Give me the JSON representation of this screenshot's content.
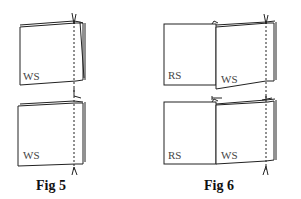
{
  "figures": [
    {
      "caption": "Fig 5",
      "panels": [
        {
          "labels": [
            "WS"
          ]
        },
        {
          "labels": [
            "WS"
          ]
        }
      ]
    },
    {
      "caption": "Fig 6",
      "panels": [
        {
          "labels": [
            "RS",
            "WS"
          ]
        },
        {
          "labels": [
            "RS",
            "WS"
          ]
        }
      ]
    }
  ],
  "colors": {
    "line": "#222222",
    "background": "#ffffff"
  }
}
